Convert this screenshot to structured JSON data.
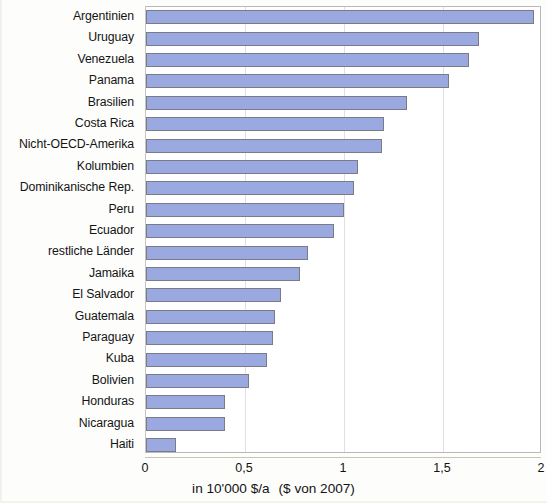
{
  "chart_data": {
    "type": "bar",
    "orientation": "horizontal",
    "title": "",
    "xlabel": "in 10'000 $/a   ($ von 2007)",
    "ylabel": "",
    "xlim": [
      0,
      2
    ],
    "xticks": [
      "0",
      "0,5",
      "1",
      "1,5",
      "2"
    ],
    "xtick_values": [
      0,
      0.5,
      1,
      1.5,
      2
    ],
    "grid": true,
    "legend": false,
    "bar_color": "#9aa9e0",
    "bar_border_color": "#7b7b88",
    "categories": [
      "Argentinien",
      "Uruguay",
      "Venezuela",
      "Panama",
      "Brasilien",
      "Costa Rica",
      "Nicht-OECD-Amerika",
      "Kolumbien",
      "Dominikanische Rep.",
      "Peru",
      "Ecuador",
      "restliche Länder",
      "Jamaika",
      "El Salvador",
      "Guatemala",
      "Paraguay",
      "Kuba",
      "Bolivien",
      "Honduras",
      "Nicaragua",
      "Haiti"
    ],
    "values": [
      1.96,
      1.68,
      1.63,
      1.53,
      1.32,
      1.2,
      1.19,
      1.07,
      1.05,
      1.0,
      0.95,
      0.82,
      0.78,
      0.68,
      0.65,
      0.64,
      0.61,
      0.52,
      0.4,
      0.4,
      0.15
    ]
  },
  "axis": {
    "title_main": "in 10'000 $/a",
    "title_paren": "($ von 2007)"
  }
}
